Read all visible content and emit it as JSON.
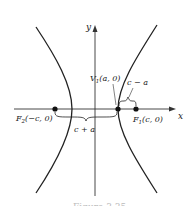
{
  "figure": {
    "type": "hyperbola-diagram",
    "caption_partial": "Figure 3.35",
    "axes": {
      "x_label": "x",
      "y_label": "y"
    },
    "points": {
      "F2": {
        "label": "F",
        "sub": "2",
        "coords": "(−c, 0)"
      },
      "F1": {
        "label": "F",
        "sub": "1",
        "coords": "(c, 0)"
      },
      "V1": {
        "label": "V",
        "sub": "1",
        "coords": "(a, 0)"
      }
    },
    "braces": {
      "c_plus_a": "c + a",
      "c_minus_a": "c − a"
    },
    "colors": {
      "curve": "#222222",
      "axis": "#333333"
    }
  }
}
